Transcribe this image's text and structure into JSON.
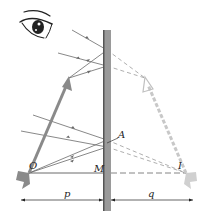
{
  "figure": {
    "type": "plane-mirror-image-formation",
    "labels": {
      "object_point": "O",
      "image_point": "I",
      "mirror_foot": "M",
      "reflection_point": "A",
      "object_distance": "p",
      "image_distance": "q"
    },
    "colors": {
      "mirror_fill": "#9a9a9a",
      "mirror_edge": "#555555",
      "object_arrow": "#8a8a8a",
      "image_arrow": "#c8c8c8",
      "ray": "#6a6a6a",
      "virtual_ray": "#9a9a9a",
      "text": "#222222"
    }
  }
}
